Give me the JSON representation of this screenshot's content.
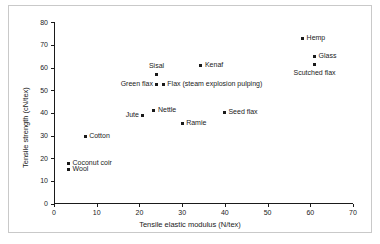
{
  "chart_data": {
    "type": "scatter",
    "title": "",
    "xlabel": "Tensile elastic modulus (N/tex)",
    "ylabel": "Tensile strength (cN/tex)",
    "xlim": [
      0,
      70
    ],
    "ylim": [
      0,
      80
    ],
    "xticks": [
      0,
      10,
      20,
      30,
      40,
      50,
      60,
      70
    ],
    "yticks": [
      0,
      10,
      20,
      30,
      40,
      50,
      60,
      70,
      80
    ],
    "grid": false,
    "legend": "none",
    "marker_color": "#1a1a1a",
    "points": [
      {
        "label": "Hemp",
        "x": 58.2,
        "y": 73.0,
        "label_pos": "right"
      },
      {
        "label": "Glass",
        "x": 61.0,
        "y": 65.0,
        "label_pos": "right"
      },
      {
        "label": "Scutched flax",
        "x": 61.0,
        "y": 61.2,
        "label_pos": "below"
      },
      {
        "label": "Kenaf",
        "x": 34.4,
        "y": 61.0,
        "label_pos": "right"
      },
      {
        "label": "Sisal",
        "x": 24.0,
        "y": 57.0,
        "label_pos": "above"
      },
      {
        "label": "Green flax",
        "x": 24.1,
        "y": 52.5,
        "label_pos": "left"
      },
      {
        "label": "Flax (steam explosion pulping)",
        "x": 25.6,
        "y": 52.5,
        "label_pos": "right"
      },
      {
        "label": "Nettle",
        "x": 23.4,
        "y": 41.0,
        "label_pos": "right"
      },
      {
        "label": "Jute",
        "x": 20.8,
        "y": 39.0,
        "label_pos": "left"
      },
      {
        "label": "Seed flax",
        "x": 39.9,
        "y": 40.2,
        "label_pos": "right"
      },
      {
        "label": "Ramie",
        "x": 30.0,
        "y": 35.5,
        "label_pos": "right"
      },
      {
        "label": "Cotton",
        "x": 7.3,
        "y": 29.8,
        "label_pos": "right"
      },
      {
        "label": "Coconut coir",
        "x": 3.4,
        "y": 17.7,
        "label_pos": "right"
      },
      {
        "label": "Wool",
        "x": 3.4,
        "y": 14.8,
        "label_pos": "right"
      }
    ]
  }
}
